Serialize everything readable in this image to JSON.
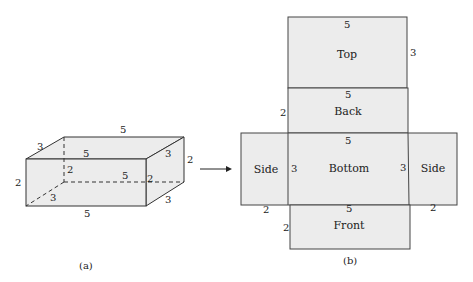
{
  "figure_a": {
    "caption": "(a)",
    "dims": {
      "back_top": "5",
      "left_top_depth": "3",
      "front_top": "5",
      "right_top_depth": "3",
      "right_height": "2",
      "left_height": "2",
      "hidden_height": "2",
      "hidden_length": "5",
      "front_right_height": "2",
      "hidden_depth": "3",
      "bottom_right_depth": "3",
      "front_bottom": "5"
    }
  },
  "figure_b": {
    "caption": "(b)",
    "faces": {
      "top": "Top",
      "back": "Back",
      "bottom": "Bottom",
      "front": "Front",
      "side_left": "Side",
      "side_right": "Side"
    },
    "dims": {
      "top_width": "5",
      "top_height": "3",
      "back_width": "5",
      "back_height": "2",
      "bottom_width": "5",
      "bottom_left": "3",
      "bottom_right": "3",
      "side_left_width": "2",
      "side_right_width": "2",
      "front_width": "5",
      "front_height": "2"
    }
  },
  "arrow": "right-arrow"
}
